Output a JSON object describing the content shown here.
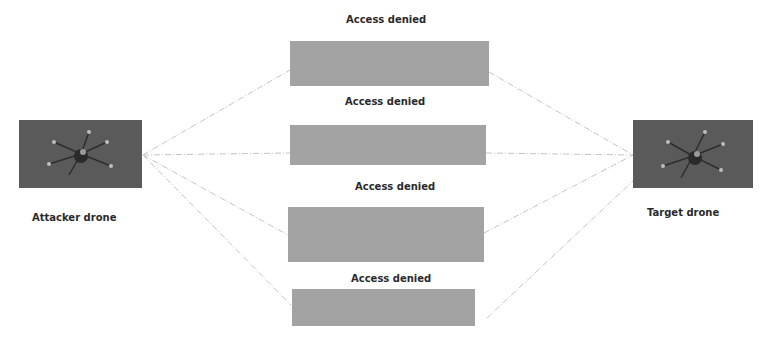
{
  "diagram": {
    "attacker": {
      "label": "Attacker drone",
      "icon": "drone-image"
    },
    "target": {
      "label": "Target drone",
      "icon": "drone-image"
    },
    "channels": [
      {
        "label": "Access denied"
      },
      {
        "label": "Access denied"
      },
      {
        "label": "Access denied"
      },
      {
        "label": "Access denied"
      }
    ],
    "colors": {
      "drone_bg": "#5a5a5a",
      "channel_box": "#a3a3a3",
      "connector": "#c8c8c8",
      "text": "#2a2a2a"
    }
  }
}
